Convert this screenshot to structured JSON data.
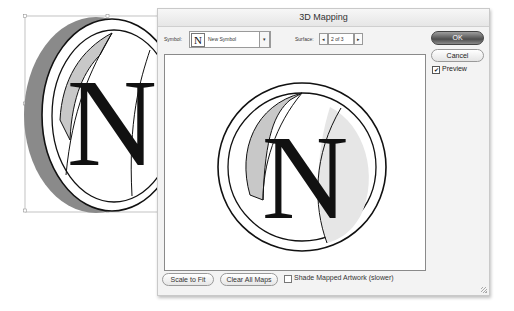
{
  "artboard": {
    "artwork_letter": "N",
    "colors": {
      "side_fill": "#8a8a8a",
      "band_fill": "#c8c8c8",
      "light_fill": "#e6e6e6",
      "stroke": "#111111",
      "selection": "#9a9a9a"
    }
  },
  "dialog": {
    "title": "3D Mapping",
    "symbol_label": "Symbol:",
    "symbol_value": "New Symbol",
    "symbol_thumb": "N",
    "symbol_arrow": "▾",
    "surface_label": "Surface:",
    "surface_value": "2 of 3",
    "surface_prev": "◂",
    "surface_next": "▸",
    "ok_label": "OK",
    "cancel_label": "Cancel",
    "preview_label": "Preview",
    "preview_checked": true,
    "check_glyph": "✔",
    "scale_to_fit_label": "Scale to Fit",
    "clear_all_maps_label": "Clear All Maps",
    "shade_label": "Shade Mapped Artwork (slower)",
    "shade_checked": false
  }
}
